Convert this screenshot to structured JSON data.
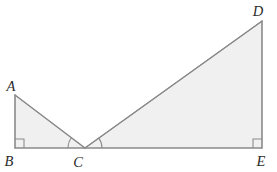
{
  "figure": {
    "canvas": {
      "width": 277,
      "height": 172
    },
    "style": {
      "fill_color": "#f0f0f0",
      "stroke_color": "#8a8a8a",
      "label_color": "#2b2b2b",
      "background_color": "#ffffff"
    },
    "points": {
      "A": {
        "x": 15,
        "y": 95,
        "label": "A",
        "label_x": 11,
        "label_y": 91
      },
      "B": {
        "x": 15,
        "y": 148,
        "label": "B",
        "label_x": 9,
        "label_y": 166
      },
      "C": {
        "x": 85,
        "y": 148,
        "label": "C",
        "label_x": 78,
        "label_y": 167
      },
      "D": {
        "x": 262,
        "y": 21,
        "label": "D",
        "label_x": 258,
        "label_y": 16
      },
      "E": {
        "x": 262,
        "y": 148,
        "label": "E",
        "label_x": 261,
        "label_y": 166
      }
    },
    "triangles": [
      {
        "name": "ABC",
        "vertices": "A,B,C",
        "right_angle_at": "B"
      },
      {
        "name": "CDE",
        "vertices": "C,D,E",
        "right_angle_at": "E"
      }
    ],
    "segments": [
      {
        "name": "AB",
        "from": "A",
        "to": "B"
      },
      {
        "name": "AC",
        "from": "A",
        "to": "C"
      },
      {
        "name": "BC",
        "from": "B",
        "to": "C"
      },
      {
        "name": "CD",
        "from": "C",
        "to": "D"
      },
      {
        "name": "CE",
        "from": "C",
        "to": "E"
      },
      {
        "name": "DE",
        "from": "D",
        "to": "E"
      }
    ],
    "right_angle_marks": [
      {
        "name": "right-angle-at-B",
        "at": "B",
        "size": 9
      },
      {
        "name": "right-angle-at-E",
        "at": "E",
        "size": 9
      }
    ],
    "angle_arcs": [
      {
        "name": "angle-ACB",
        "at": "C",
        "between": "CA,CB",
        "radius": 17
      },
      {
        "name": "angle-DCE",
        "at": "C",
        "between": "CD,CE",
        "radius": 17
      }
    ]
  }
}
